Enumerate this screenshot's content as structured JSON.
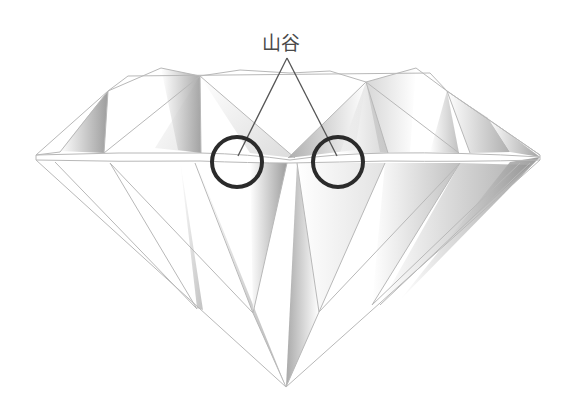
{
  "diagram": {
    "label": "山谷",
    "callouts": [
      {
        "name": "valley-left",
        "center": [
          237,
          162
        ],
        "radius": 25
      },
      {
        "name": "valley-right",
        "center": [
          338,
          162
        ],
        "radius": 25
      }
    ],
    "colors": {
      "outline": "#b8b8b8",
      "shade_dark": "#8a8a8a",
      "circle": "#2b2b2b",
      "pointer": "#555555",
      "label": "#4a4a4a"
    }
  }
}
